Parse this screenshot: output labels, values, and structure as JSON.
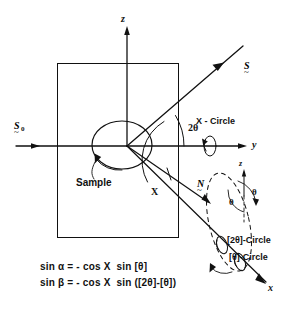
{
  "figure": {
    "axes": {
      "z_axis_label": "z",
      "y_axis_label": "y",
      "x_axis_label": "x",
      "z_axis_label_secondary": "z"
    },
    "vectors": {
      "incident_beam": "S",
      "incident_beam_subscript": "0",
      "incident_beam_tilde": "~",
      "diffracted_beam": "S",
      "diffracted_beam_tilde": "~",
      "normal": "N",
      "normal_tilde": "~"
    },
    "angles": {
      "two_theta": "2θ",
      "chi": "X",
      "theta_left": "θ",
      "theta_right": "θ"
    },
    "labels": {
      "sample": "Sample",
      "chi_circle": "X - Circle",
      "two_theta_circle": "[2θ]-Circle",
      "theta_circle": "[θ]-Circle"
    },
    "equations": [
      {
        "lhs_fn": "sin",
        "lhs_var": "α",
        "eq": "=",
        "rhs": "- cos X  sin [θ]",
        "full": "sin α = - cos X  sin [θ]"
      },
      {
        "lhs_fn": "sin",
        "lhs_var": "β",
        "eq": "=",
        "rhs": "- cos X  sin ([2θ]-[θ])",
        "full": "sin β = - cos X  sin ([2θ]-[θ])"
      }
    ],
    "colors": {
      "ink": "#111111",
      "background": "#ffffff"
    }
  }
}
